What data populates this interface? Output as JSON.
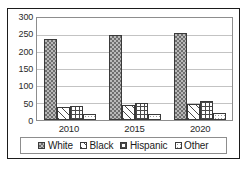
{
  "chart_data": {
    "type": "bar",
    "title": "",
    "subtitle": "",
    "xlabel": "",
    "ylabel": "",
    "categories": [
      "2010",
      "2015",
      "2020"
    ],
    "series": [
      {
        "name": "White",
        "values": [
          238,
          249,
          256
        ],
        "pattern": "dense-checker-gray"
      },
      {
        "name": "Black",
        "values": [
          38,
          44,
          47
        ],
        "pattern": "diagonal-stripes"
      },
      {
        "name": "Hispanic",
        "values": [
          42,
          49,
          56
        ],
        "pattern": "crosshatch-grid"
      },
      {
        "name": "Other",
        "values": [
          18,
          19,
          22
        ],
        "pattern": "sparse-dots"
      }
    ],
    "ylim": [
      0,
      300
    ],
    "yticks": [
      0,
      50,
      100,
      150,
      200,
      250,
      300
    ],
    "ytick_labels": [
      "0",
      "50",
      "100",
      "150",
      "200",
      "250",
      "300"
    ],
    "grid": true,
    "grid_axis": "y",
    "legend_position": "bottom",
    "legend_entries": [
      "White",
      "Black",
      "Hispanic",
      "Other"
    ],
    "colors": {
      "bar_outline": "#3a3a3a",
      "gridline": "#c3c3c3",
      "plot_border": "#8d8d8d",
      "figure_border": "#1b1b1b",
      "background": "#ffffff",
      "text": "#2a2a2a"
    }
  }
}
